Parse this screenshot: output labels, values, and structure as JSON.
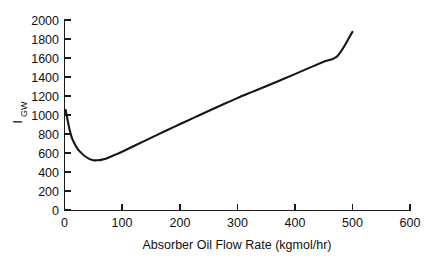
{
  "chart_data": {
    "type": "line",
    "title": "",
    "subtitle": "",
    "xlabel": "Absorber Oil Flow Rate (kgmol/hr)",
    "ylabel": "I",
    "ylabel_subscript": "GW",
    "ylabel_full": "IGW",
    "xlim": [
      0,
      600
    ],
    "ylim": [
      0,
      2000
    ],
    "xticks": [
      0,
      100,
      200,
      300,
      400,
      500,
      600
    ],
    "yticks": [
      0,
      200,
      400,
      600,
      800,
      1000,
      1200,
      1400,
      1600,
      1800,
      2000
    ],
    "xtick_labels": [
      "0",
      "100",
      "200",
      "300",
      "400",
      "500",
      "600"
    ],
    "ytick_labels": [
      "0",
      "200",
      "400",
      "600",
      "800",
      "1000",
      "1200",
      "1400",
      "1600",
      "1800",
      "2000"
    ],
    "grid": false,
    "legend": null,
    "legend_position": "none",
    "annotations": [],
    "line_color": "#151515",
    "background_color": "#ffffff",
    "series": [
      {
        "name": "IGW",
        "x": [
          2,
          5,
          9,
          13,
          18,
          23,
          29,
          35,
          42,
          50,
          57,
          65,
          75,
          88,
          100,
          125,
          150,
          175,
          200,
          225,
          250,
          275,
          300,
          325,
          350,
          375,
          400,
          425,
          450,
          475,
          500
        ],
        "y": [
          1055,
          960,
          845,
          760,
          695,
          645,
          605,
          572,
          545,
          528,
          527,
          534,
          552,
          585,
          617,
          690,
          762,
          835,
          905,
          975,
          1045,
          1113,
          1180,
          1243,
          1305,
          1368,
          1432,
          1497,
          1562,
          1628,
          1875
        ]
      }
    ],
    "minimum_point": {
      "x": 55,
      "y": 527
    },
    "start_point": {
      "x": 2,
      "y": 1055
    },
    "end_point": {
      "x": 500,
      "y": 1875
    }
  },
  "figure": {
    "axis_line_color": "#1a1a1a",
    "text_color": "#111111"
  }
}
